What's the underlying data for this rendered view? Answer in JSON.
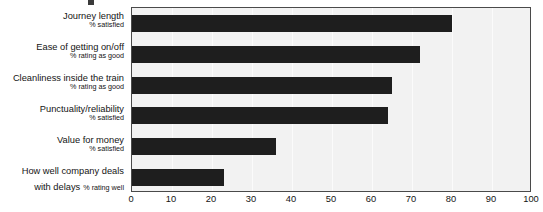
{
  "chart_data": {
    "type": "bar",
    "orientation": "horizontal",
    "title": "",
    "xlabel": "",
    "ylabel": "",
    "xlim": [
      0,
      100
    ],
    "xticks": [
      0,
      10,
      20,
      30,
      40,
      50,
      60,
      70,
      80,
      90,
      100
    ],
    "grid": true,
    "legend": "none",
    "bar_color": "#1e1e1e",
    "plot_background": "#f2f2f2",
    "categories": [
      "Journey length",
      "Ease of getting on/off",
      "Cleanliness inside the train",
      "Punctuality/reliability",
      "Value for money",
      "How well company deals with delays"
    ],
    "values": [
      80,
      72,
      65,
      64,
      36,
      23
    ],
    "items": [
      {
        "label": "Journey length",
        "sub": "% satisfied",
        "value": 80,
        "inline": false
      },
      {
        "label": "Ease of getting on/off",
        "sub": "% rating as good",
        "value": 72,
        "inline": false
      },
      {
        "label": "Cleanliness inside the train",
        "sub": "% rating as good",
        "value": 65,
        "inline": false
      },
      {
        "label": "Punctuality/reliability",
        "sub": "% satisfied",
        "value": 64,
        "inline": false
      },
      {
        "label": "Value for money",
        "sub": "% satisfied",
        "value": 36,
        "inline": false
      },
      {
        "label": "How well company deals",
        "sub": "",
        "value": 23,
        "inline": false
      },
      {
        "label": "with delays",
        "sub": "% rating well",
        "value": null,
        "inline": true
      }
    ]
  }
}
